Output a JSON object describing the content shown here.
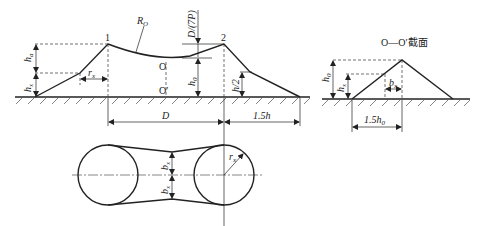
{
  "diagram": {
    "main_profile": {
      "points": {
        "p1": "1",
        "p2": "2",
        "o": "O",
        "o_prime": "O′"
      },
      "labels": {
        "radius": "R",
        "radius_sub": "O",
        "ha": "h",
        "ha_sub": "a",
        "hx": "h",
        "hx_sub": "x",
        "rx": "r",
        "rx_sub": "x",
        "h0": "h",
        "h0_sub": "0",
        "h_half": "h/2",
        "dtp": "D/(7P)",
        "D": "D",
        "one_five_h": "1.5h"
      }
    },
    "section": {
      "title": "O—O′截面",
      "labels": {
        "h0": "h",
        "h0_sub": "0",
        "hx": "h",
        "hx_sub": "x",
        "bx": "b",
        "bx_sub": "x",
        "base": "1.5h",
        "base_sub": "0"
      }
    },
    "plan_view": {
      "labels": {
        "bx_top": "b",
        "bx_top_sub": "x",
        "bx_bottom": "b",
        "bx_bottom_sub": "x",
        "rx": "r",
        "rx_sub": "x"
      }
    }
  }
}
